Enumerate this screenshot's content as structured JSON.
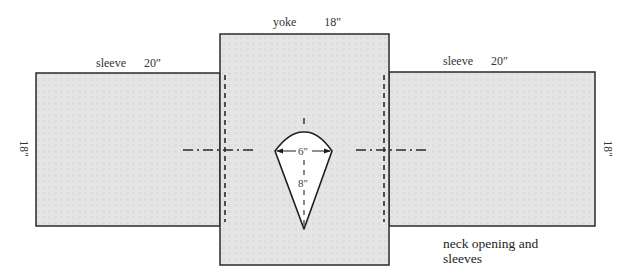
{
  "diagram": {
    "type": "sewing-pattern",
    "pieces": [
      {
        "id": "left-sleeve",
        "label": "sleeve",
        "width_label": "20″",
        "height_label": "18″"
      },
      {
        "id": "yoke",
        "label": "yoke",
        "width_label": "18″"
      },
      {
        "id": "right-sleeve",
        "label": "sleeve",
        "width_label": "20″",
        "height_label": "18″"
      }
    ],
    "neck_opening": {
      "width_label": "6″",
      "depth_label": "8″"
    },
    "caption": {
      "line1": "neck opening and",
      "line2": "sleeves"
    },
    "colors": {
      "fill": "#e4e4e4",
      "outline": "#2a2a2a",
      "neck_fill": "#ffffff"
    }
  }
}
